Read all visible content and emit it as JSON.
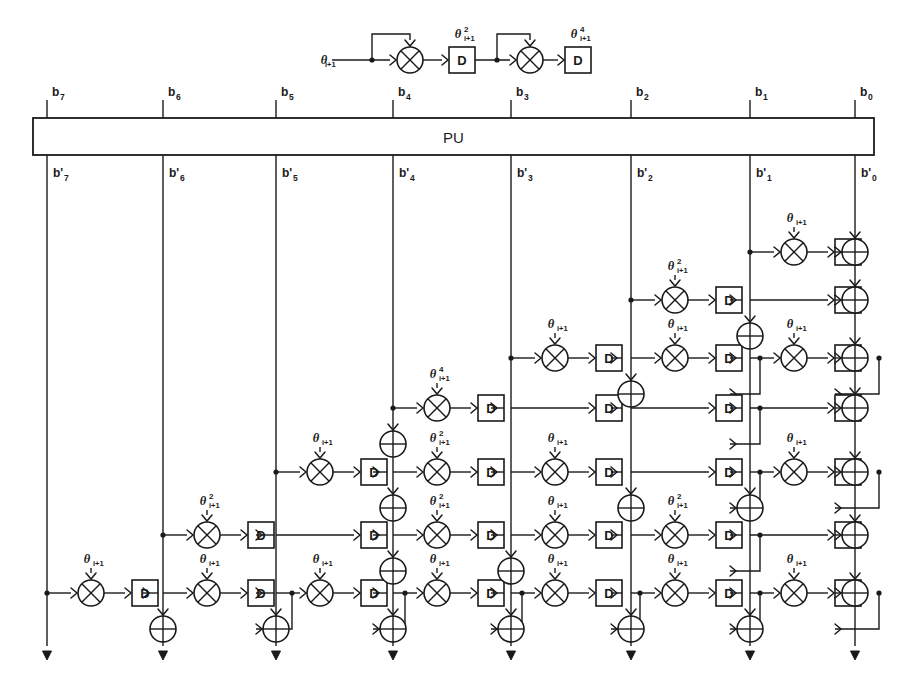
{
  "diagram": {
    "pu_label": "PU",
    "theta_symbol": "θ",
    "theta_subscript": "i+1",
    "delay_label": "D",
    "icons": {
      "multiplier": "multiplier-circle-cross-icon",
      "adder": "adder-circle-plus-icon",
      "delay": "delay-box-icon",
      "tap": "junction-dot-icon",
      "arrow": "arrowhead-icon"
    },
    "colors": {
      "line": "#1a1a1a",
      "fill": "#ffffff",
      "background": "#ffffff"
    },
    "legend": {
      "input_label": "θ",
      "input_sub": "i+1",
      "stages": [
        {
          "mult": "multiplier",
          "delay": "D",
          "out_base": "θ",
          "out_sup": "2",
          "out_sub": "i+1"
        },
        {
          "mult": "multiplier",
          "delay": "D",
          "out_base": "θ",
          "out_sup": "4",
          "out_sub": "i+1"
        }
      ]
    },
    "top_bits": [
      {
        "base": "b",
        "sub": "7",
        "x": 47
      },
      {
        "base": "b",
        "sub": "6",
        "x": 163
      },
      {
        "base": "b",
        "sub": "5",
        "x": 276
      },
      {
        "base": "b",
        "sub": "4",
        "x": 393
      },
      {
        "base": "b",
        "sub": "3",
        "x": 511
      },
      {
        "base": "b",
        "sub": "2",
        "x": 631
      },
      {
        "base": "b",
        "sub": "1",
        "x": 750
      },
      {
        "base": "b",
        "sub": "0",
        "x": 855
      }
    ],
    "bottom_bits": [
      {
        "base": "b'",
        "sub": "7",
        "x": 47
      },
      {
        "base": "b'",
        "sub": "6",
        "x": 163
      },
      {
        "base": "b'",
        "sub": "5",
        "x": 276
      },
      {
        "base": "b'",
        "sub": "4",
        "x": 393
      },
      {
        "base": "b'",
        "sub": "3",
        "x": 511
      },
      {
        "base": "b'",
        "sub": "2",
        "x": 631
      },
      {
        "base": "b'",
        "sub": "1",
        "x": 750
      },
      {
        "base": "b'",
        "sub": "0",
        "x": 855
      }
    ],
    "columns_x": [
      47,
      163,
      276,
      393,
      511,
      631,
      750,
      855
    ],
    "rows_y": [
      252,
      300,
      358,
      408,
      472,
      535,
      593
    ],
    "cells": [
      {
        "row": 0,
        "col": 6,
        "type": "mult_delay",
        "theta_sup": "",
        "tap": true
      },
      {
        "row": 0,
        "col": 7,
        "type": "adder"
      },
      {
        "row": 1,
        "col": 5,
        "type": "mult_delay",
        "theta_sup": "2",
        "tap": true
      },
      {
        "row": 1,
        "col": 6,
        "type": "delay"
      },
      {
        "row": 1,
        "col": 7,
        "type": "adder"
      },
      {
        "row": 2,
        "col": 4,
        "type": "mult_delay",
        "theta_sup": "",
        "tap": true
      },
      {
        "row": 2,
        "col": 5,
        "type": "mult_delay_branch",
        "theta_sup": "",
        "tap": false
      },
      {
        "row": 2,
        "col": 6,
        "type": "mult_delay_branch",
        "theta_sup": "",
        "tap": false
      },
      {
        "row": 2,
        "col": 7,
        "type": "adder"
      },
      {
        "row": 3,
        "col": 3,
        "type": "mult_delay",
        "theta_sup": "4",
        "tap": true
      },
      {
        "row": 3,
        "col": 4,
        "type": "delay"
      },
      {
        "row": 3,
        "col": 5,
        "type": "delay_branch"
      },
      {
        "row": 3,
        "col": 6,
        "type": "delay"
      },
      {
        "row": 3,
        "col": 7,
        "type": "adder"
      },
      {
        "row": 4,
        "col": 2,
        "type": "mult_delay",
        "theta_sup": "",
        "tap": true
      },
      {
        "row": 4,
        "col": 3,
        "type": "mult_delay",
        "theta_sup": "2",
        "tap": false
      },
      {
        "row": 4,
        "col": 4,
        "type": "mult_delay",
        "theta_sup": "",
        "tap": false
      },
      {
        "row": 4,
        "col": 5,
        "type": "delay_branch"
      },
      {
        "row": 4,
        "col": 6,
        "type": "mult_delay_branch",
        "theta_sup": "",
        "tap": false
      },
      {
        "row": 4,
        "col": 7,
        "type": "adder"
      },
      {
        "row": 5,
        "col": 1,
        "type": "mult_delay",
        "theta_sup": "2",
        "tap": true
      },
      {
        "row": 5,
        "col": 2,
        "type": "delay"
      },
      {
        "row": 5,
        "col": 3,
        "type": "mult_delay",
        "theta_sup": "2",
        "tap": false
      },
      {
        "row": 5,
        "col": 4,
        "type": "mult_delay",
        "theta_sup": "",
        "tap": false
      },
      {
        "row": 5,
        "col": 5,
        "type": "mult_delay_branch",
        "theta_sup": "2",
        "tap": false
      },
      {
        "row": 5,
        "col": 6,
        "type": "delay"
      },
      {
        "row": 5,
        "col": 7,
        "type": "adder"
      },
      {
        "row": 6,
        "col": 0,
        "type": "mult_delay",
        "theta_sup": "",
        "tap": true
      },
      {
        "row": 6,
        "col": 1,
        "type": "mult_delay_branch",
        "theta_sup": "",
        "tap": false
      },
      {
        "row": 6,
        "col": 2,
        "type": "mult_delay_branch",
        "theta_sup": "",
        "tap": false
      },
      {
        "row": 6,
        "col": 3,
        "type": "mult_delay_branch",
        "theta_sup": "",
        "tap": false
      },
      {
        "row": 6,
        "col": 4,
        "type": "mult_delay_branch",
        "theta_sup": "",
        "tap": false
      },
      {
        "row": 6,
        "col": 5,
        "type": "mult_delay_branch",
        "theta_sup": "",
        "tap": false
      },
      {
        "row": 6,
        "col": 6,
        "type": "mult_delay_branch",
        "theta_sup": "",
        "tap": false
      },
      {
        "row": 6,
        "col": 7,
        "type": "adder"
      }
    ],
    "column_adders": [
      {
        "col": 3,
        "row": 4
      },
      {
        "col": 3,
        "row": 5
      },
      {
        "col": 3,
        "row": 6
      },
      {
        "col": 4,
        "row": 6
      },
      {
        "col": 5,
        "row": 3
      },
      {
        "col": 5,
        "row": 5
      },
      {
        "col": 6,
        "row": 2
      },
      {
        "col": 6,
        "row": 5
      }
    ],
    "geometry": {
      "pu_top": 118,
      "pu_bottom": 155,
      "pu_left": 33,
      "pu_right": 874,
      "tick_top": 100,
      "bottom_end": 660,
      "cell_mult_dx": 30,
      "cell_delay_dx": 72,
      "radius_mult": 13,
      "radius_add": 13,
      "delay_w": 26,
      "delay_h": 26
    }
  }
}
